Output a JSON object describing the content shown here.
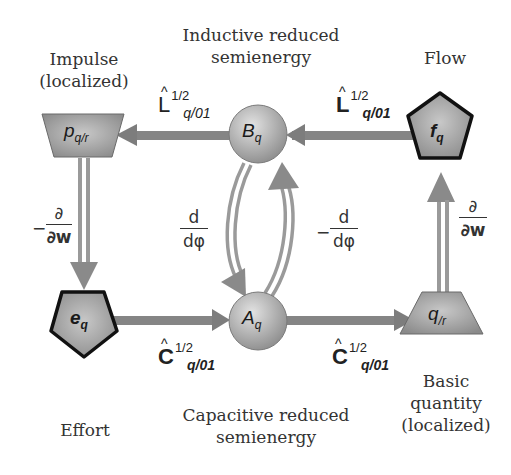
{
  "colors": {
    "arrow": "#8a8a8a",
    "arrow_dark": "#7a7a7a",
    "node_fill_light": "#cfcfcf",
    "node_fill_dark": "#8f8f8f",
    "outline_bold": "#111111",
    "text": "#333333"
  },
  "captions": {
    "impulse": [
      "Impulse",
      "(localized)"
    ],
    "inductive": [
      "Inductive reduced",
      "semienergy"
    ],
    "flow": [
      "Flow"
    ],
    "effort": [
      "Effort"
    ],
    "capacitive": [
      "Capacitive reduced",
      "semienergy"
    ],
    "basic": [
      "Basic",
      "quantity",
      "(localized)"
    ]
  },
  "nodes": {
    "p": {
      "symbol": "p",
      "sub": "q/r",
      "shape": "inverted-trapezoid"
    },
    "B": {
      "symbol": "B",
      "sub": "q",
      "shape": "circle"
    },
    "f": {
      "symbol": "f",
      "sub": "q",
      "shape": "pentagon-bold"
    },
    "e": {
      "symbol": "e",
      "sub": "q",
      "shape": "pentagon-bold"
    },
    "A": {
      "symbol": "A",
      "sub": "q",
      "shape": "circle"
    },
    "q": {
      "symbol": "q",
      "sub": "/r",
      "shape": "trapezoid"
    }
  },
  "operators": {
    "L_left": {
      "main": "L",
      "hat": "^",
      "sup": "1/2",
      "sub": "q/01",
      "bold": false
    },
    "L_right": {
      "main": "L",
      "hat": "^",
      "sup": "1/2",
      "sub": "q/01",
      "bold": true
    },
    "C_left": {
      "main": "C",
      "hat": "^",
      "sup": "1/2",
      "sub": "q/01",
      "bold": true
    },
    "C_right": {
      "main": "C",
      "hat": "^",
      "sup": "1/2",
      "sub": "q/01",
      "bold": true
    },
    "dw_left": {
      "sign": "−",
      "num": "∂",
      "den": "∂w"
    },
    "dw_right": {
      "sign": "",
      "num": "∂",
      "den": "∂w"
    },
    "dphi_left": {
      "sign": "",
      "num": "d",
      "den": "dφ"
    },
    "dphi_right": {
      "sign": "−",
      "num": "d",
      "den": "dφ"
    }
  },
  "edges": [
    {
      "from": "f",
      "to": "B",
      "label": "L_right",
      "style": "single"
    },
    {
      "from": "B",
      "to": "p",
      "label": "L_left",
      "style": "single"
    },
    {
      "from": "p",
      "to": "e",
      "label": "dw_left",
      "style": "double"
    },
    {
      "from": "e",
      "to": "A",
      "label": "C_left",
      "style": "single"
    },
    {
      "from": "A",
      "to": "q",
      "label": "C_right",
      "style": "single"
    },
    {
      "from": "q",
      "to": "f",
      "label": "dw_right",
      "style": "double"
    },
    {
      "from": "B",
      "to": "A",
      "label": "dphi_left",
      "style": "double-curved"
    },
    {
      "from": "A",
      "to": "B",
      "label": "dphi_right",
      "style": "double-curved"
    }
  ]
}
